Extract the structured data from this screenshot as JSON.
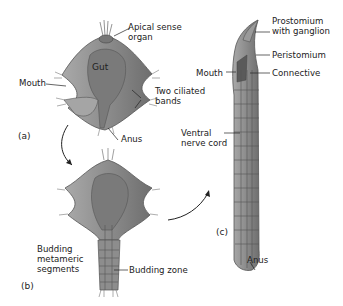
{
  "figure": {
    "panels": [
      {
        "id": "a",
        "label": "(a)",
        "stage": "trochophore larva"
      },
      {
        "id": "b",
        "label": "(b)",
        "stage": "budding larva"
      },
      {
        "id": "c",
        "label": "(c)",
        "stage": "juvenile worm"
      }
    ],
    "labels": {
      "apical_1": "Apical sense",
      "apical_2": "organ",
      "gut": "Gut",
      "mouth_a": "Mouth",
      "ciliated_1": "Two ciliated",
      "ciliated_2": "bands",
      "anus_a": "Anus",
      "budding_seg_1": "Budding",
      "budding_seg_2": "metameric",
      "budding_seg_3": "segments",
      "budding_zone": "Budding zone",
      "prostomium_1": "Prostomium",
      "prostomium_2": "with ganglion",
      "peristomium": "Peristomium",
      "mouth_c": "Mouth",
      "connective": "Connective",
      "ventral_1": "Ventral",
      "ventral_2": "nerve cord",
      "anus_c": "Anus"
    },
    "colors": {
      "body": "#8a8a8a",
      "body_dark": "#5e5e5e",
      "body_light": "#b5b5b5",
      "line": "#222222"
    }
  }
}
